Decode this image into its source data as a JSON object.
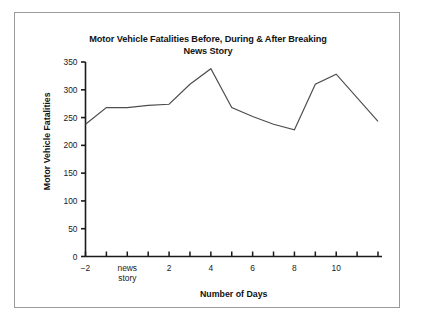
{
  "chart_data": {
    "type": "line",
    "title": "Motor Vehicle Fatalities Before, During & After Breaking News Story",
    "title_line1": "Motor Vehicle Fatalities Before, During & After Breaking",
    "title_line2": "News Story",
    "xlabel": "Number of Days",
    "ylabel": "Motor Vehicle  Fatalities",
    "ylim": [
      0,
      350
    ],
    "xlim": [
      -2,
      12
    ],
    "grid": false,
    "legend": null,
    "y_ticks": [
      0,
      50,
      100,
      150,
      200,
      250,
      300,
      350
    ],
    "y_tick_labels": [
      "0",
      "50",
      "100",
      "150",
      "200",
      "250",
      "300",
      "350"
    ],
    "x_ticks": [
      -2,
      -1,
      0,
      1,
      2,
      3,
      4,
      5,
      6,
      7,
      8,
      9,
      10,
      11,
      12
    ],
    "x_tick_labels": [
      "−2",
      "",
      "news story",
      "",
      "2",
      "",
      "4",
      "",
      "6",
      "",
      "8",
      "",
      "10",
      "",
      ""
    ],
    "x_labeled_ticks": [
      {
        "x": -2,
        "label": "−2"
      },
      {
        "x": 0,
        "label": "news",
        "label2": "story"
      },
      {
        "x": 2,
        "label": "2"
      },
      {
        "x": 4,
        "label": "4"
      },
      {
        "x": 6,
        "label": "6"
      },
      {
        "x": 8,
        "label": "8"
      },
      {
        "x": 10,
        "label": "10"
      }
    ],
    "x": [
      -2,
      -1,
      0,
      1,
      2,
      3,
      4,
      5,
      6,
      7,
      8,
      9,
      10,
      12
    ],
    "values": [
      238,
      268,
      268,
      272,
      274,
      310,
      338,
      268,
      252,
      238,
      228,
      310,
      328,
      243
    ],
    "series": [
      {
        "name": "Motor Vehicle Fatalities",
        "color": "#4d4d4d",
        "points": [
          {
            "x": -2,
            "y": 238
          },
          {
            "x": -1,
            "y": 268
          },
          {
            "x": 0,
            "y": 268
          },
          {
            "x": 1,
            "y": 272
          },
          {
            "x": 2,
            "y": 274
          },
          {
            "x": 3,
            "y": 310
          },
          {
            "x": 4,
            "y": 338
          },
          {
            "x": 5,
            "y": 268
          },
          {
            "x": 6,
            "y": 252
          },
          {
            "x": 7,
            "y": 238
          },
          {
            "x": 8,
            "y": 228
          },
          {
            "x": 9,
            "y": 310
          },
          {
            "x": 10,
            "y": 328
          },
          {
            "x": 12,
            "y": 243
          }
        ]
      }
    ],
    "colors": {
      "line": "#4d4d4d",
      "axis": "#1a1a1a",
      "text": "#141414",
      "frame": "#9a9a9a",
      "background": "#ffffff"
    }
  }
}
